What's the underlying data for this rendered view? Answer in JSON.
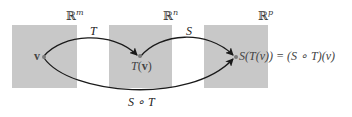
{
  "spaces": [
    {
      "name": "domain",
      "symbol": "ℝ",
      "exponent": "m"
    },
    {
      "name": "intermediate",
      "symbol": "ℝ",
      "exponent": "n"
    },
    {
      "name": "codomain",
      "symbol": "ℝ",
      "exponent": "p"
    }
  ],
  "maps": {
    "T": "T",
    "S": "S",
    "composite": "S ∘ T"
  },
  "points": {
    "v": "v",
    "Tv_func": "T",
    "Tv_arg": "v",
    "result_text": "S(T(v)) = (S ∘ T)(v)"
  },
  "colors": {
    "box_fill": "#c8c8c8",
    "arrow": "#1a1a1a",
    "point": "#7a7a7a"
  }
}
